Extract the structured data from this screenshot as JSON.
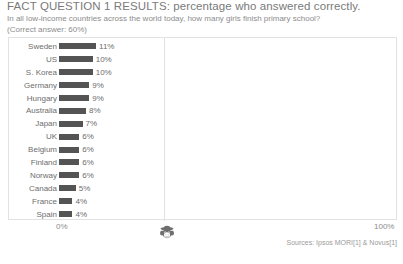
{
  "header": {
    "title": "FACT QUESTION 1 RESULTS: percentage who answered correctly.",
    "subtitle": "In all low-income countries across the world today, how many girls finish primary school?",
    "note": "(Correct answer: 60%)"
  },
  "axis": {
    "min_label": "0%",
    "max_label": "100%"
  },
  "footer": {
    "sources": "Sources: Ipsos MORI[1] & Novus[1]"
  },
  "icons": {
    "monkey": "monkey-face-icon"
  },
  "colors": {
    "bar_fill": "#545454",
    "frame": "#e2e2e2",
    "text": "#6d6d6d",
    "title_text": "#7a7a7a"
  },
  "chart_data": {
    "type": "bar",
    "orientation": "horizontal",
    "title": "FACT QUESTION 1 RESULTS: percentage who answered correctly.",
    "subtitle": "In all low-income countries across the world today, how many girls finish primary school?",
    "annotation": "(Correct answer: 60%)",
    "xlabel": "",
    "ylabel": "",
    "xlim": [
      0,
      100
    ],
    "xticks": [
      0,
      100
    ],
    "xticklabels": [
      "0%",
      "100%"
    ],
    "grid": false,
    "legend": null,
    "categories": [
      "Sweden",
      "US",
      "S. Korea",
      "Germany",
      "Hungary",
      "Australia",
      "Japan",
      "UK",
      "Belgium",
      "Finland",
      "Norway",
      "Canada",
      "France",
      "Spain"
    ],
    "values": [
      11,
      10,
      10,
      9,
      9,
      8,
      7,
      6,
      6,
      6,
      6,
      5,
      4,
      4
    ],
    "value_labels": [
      "11%",
      "10%",
      "10%",
      "9%",
      "9%",
      "8%",
      "7%",
      "6%",
      "6%",
      "6%",
      "6%",
      "5%",
      "4%",
      "4%"
    ],
    "rows": [
      {
        "label": "Sweden",
        "value": 11,
        "value_label": "11%"
      },
      {
        "label": "US",
        "value": 10,
        "value_label": "10%"
      },
      {
        "label": "S. Korea",
        "value": 10,
        "value_label": "10%"
      },
      {
        "label": "Germany",
        "value": 9,
        "value_label": "9%"
      },
      {
        "label": "Hungary",
        "value": 9,
        "value_label": "9%"
      },
      {
        "label": "Australia",
        "value": 8,
        "value_label": "8%"
      },
      {
        "label": "Japan",
        "value": 7,
        "value_label": "7%"
      },
      {
        "label": "UK",
        "value": 6,
        "value_label": "6%"
      },
      {
        "label": "Belgium",
        "value": 6,
        "value_label": "6%"
      },
      {
        "label": "Finland",
        "value": 6,
        "value_label": "6%"
      },
      {
        "label": "Norway",
        "value": 6,
        "value_label": "6%"
      },
      {
        "label": "Canada",
        "value": 5,
        "value_label": "5%"
      },
      {
        "label": "France",
        "value": 4,
        "value_label": "4%"
      },
      {
        "label": "Spain",
        "value": 4,
        "value_label": "4%"
      }
    ]
  }
}
